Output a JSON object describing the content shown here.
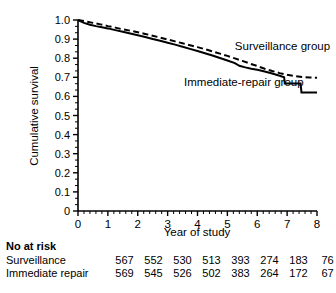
{
  "chart_data": {
    "type": "line",
    "title": "",
    "xlabel": "Year of study",
    "ylabel": "Cumulative survival",
    "xlim": [
      0,
      8
    ],
    "ylim": [
      0,
      1.0
    ],
    "grid": false,
    "x_ticks": [
      "0",
      "1",
      "2",
      "3",
      "4",
      "5",
      "6",
      "7",
      "8"
    ],
    "y_ticks": [
      "0",
      "0.1",
      "0.2",
      "0.3",
      "0.4",
      "0.5",
      "0.6",
      "0.7",
      "0.8",
      "0.9",
      "1.0"
    ],
    "x_minor_ticks_per_interval": 4,
    "y_minor_ticks_per_interval": 2,
    "legend_position": "inline-annotation",
    "series": [
      {
        "name": "Surveillance group",
        "style": "dashed",
        "color": "#000000",
        "label_x": 5.25,
        "label_y": 0.845,
        "points": [
          [
            0.0,
            1.0
          ],
          [
            0.25,
            0.993
          ],
          [
            0.5,
            0.985
          ],
          [
            0.75,
            0.977
          ],
          [
            1.0,
            0.968
          ],
          [
            1.25,
            0.96
          ],
          [
            1.5,
            0.951
          ],
          [
            1.75,
            0.944
          ],
          [
            2.0,
            0.936
          ],
          [
            2.25,
            0.927
          ],
          [
            2.5,
            0.918
          ],
          [
            2.75,
            0.908
          ],
          [
            3.0,
            0.898
          ],
          [
            3.25,
            0.888
          ],
          [
            3.5,
            0.878
          ],
          [
            3.75,
            0.868
          ],
          [
            4.0,
            0.858
          ],
          [
            4.25,
            0.847
          ],
          [
            4.5,
            0.836
          ],
          [
            4.75,
            0.824
          ],
          [
            5.0,
            0.812
          ],
          [
            5.25,
            0.799
          ],
          [
            5.5,
            0.786
          ],
          [
            5.75,
            0.772
          ],
          [
            6.0,
            0.759
          ],
          [
            6.25,
            0.745
          ],
          [
            6.5,
            0.733
          ],
          [
            6.75,
            0.722
          ],
          [
            7.0,
            0.713
          ],
          [
            7.25,
            0.707
          ],
          [
            7.5,
            0.702
          ],
          [
            7.75,
            0.699
          ],
          [
            8.0,
            0.697
          ]
        ]
      },
      {
        "name": "Immediate-repair group",
        "style": "solid",
        "color": "#000000",
        "label_x": 3.55,
        "label_y": 0.655,
        "points": [
          [
            0.0,
            1.0
          ],
          [
            0.2,
            0.985
          ],
          [
            0.4,
            0.975
          ],
          [
            0.6,
            0.968
          ],
          [
            0.8,
            0.962
          ],
          [
            1.0,
            0.956
          ],
          [
            1.25,
            0.947
          ],
          [
            1.5,
            0.938
          ],
          [
            1.75,
            0.929
          ],
          [
            2.0,
            0.92
          ],
          [
            2.25,
            0.911
          ],
          [
            2.5,
            0.901
          ],
          [
            2.75,
            0.891
          ],
          [
            3.0,
            0.881
          ],
          [
            3.25,
            0.871
          ],
          [
            3.5,
            0.86
          ],
          [
            3.75,
            0.849
          ],
          [
            4.0,
            0.838
          ],
          [
            4.25,
            0.826
          ],
          [
            4.5,
            0.814
          ],
          [
            4.75,
            0.801
          ],
          [
            5.0,
            0.788
          ],
          [
            5.25,
            0.774
          ],
          [
            5.4,
            0.76
          ],
          [
            5.6,
            0.752
          ],
          [
            5.8,
            0.745
          ],
          [
            6.0,
            0.739
          ],
          [
            6.25,
            0.73
          ],
          [
            6.5,
            0.72
          ],
          [
            6.75,
            0.708
          ],
          [
            6.9,
            0.7
          ],
          [
            6.92,
            0.668
          ],
          [
            7.45,
            0.668
          ],
          [
            7.48,
            0.62
          ],
          [
            8.0,
            0.62
          ]
        ]
      }
    ]
  },
  "risk_table": {
    "title": "No at risk",
    "rows": [
      {
        "label": "Surveillance",
        "values": [
          "567",
          "552",
          "530",
          "513",
          "393",
          "274",
          "183",
          "76"
        ]
      },
      {
        "label": "Immediate repair",
        "values": [
          "569",
          "545",
          "526",
          "502",
          "383",
          "264",
          "172",
          "67"
        ]
      }
    ]
  }
}
